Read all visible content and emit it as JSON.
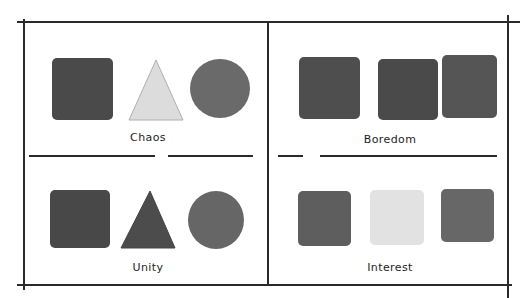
{
  "panels": [
    {
      "id": "chaos",
      "label": "Chaos",
      "shapes": [
        {
          "type": "square",
          "tone": "dark",
          "color": "#4a4a4a"
        },
        {
          "type": "triangle",
          "tone": "light",
          "color": "#dcdcdc"
        },
        {
          "type": "circle",
          "tone": "mid-dark",
          "color": "#6a6a6a"
        }
      ]
    },
    {
      "id": "boredom",
      "label": "Boredom",
      "shapes": [
        {
          "type": "square",
          "tone": "dark",
          "color": "#4e4e4e"
        },
        {
          "type": "square",
          "tone": "dark",
          "color": "#4a4a4a"
        },
        {
          "type": "square",
          "tone": "dark",
          "color": "#555555"
        }
      ]
    },
    {
      "id": "unity",
      "label": "Unity",
      "shapes": [
        {
          "type": "square",
          "tone": "dark",
          "color": "#484848"
        },
        {
          "type": "triangle",
          "tone": "dark",
          "color": "#4c4c4c"
        },
        {
          "type": "circle",
          "tone": "mid-dark",
          "color": "#666666"
        }
      ]
    },
    {
      "id": "interest",
      "label": "Interest",
      "shapes": [
        {
          "type": "square",
          "tone": "mid-dark",
          "color": "#5e5e5e"
        },
        {
          "type": "square",
          "tone": "light",
          "color": "#e2e2e2"
        },
        {
          "type": "square",
          "tone": "mid-dark",
          "color": "#676767"
        }
      ]
    }
  ],
  "colors": {
    "line": "#2a2a2a",
    "text": "#1e1e1e",
    "background": "#ffffff"
  }
}
